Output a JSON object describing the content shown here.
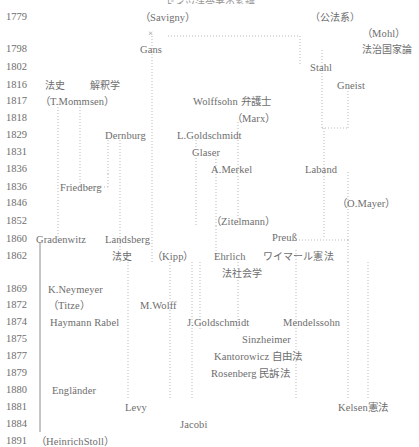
{
  "document": {
    "title": "ドイツ法学者の系譜",
    "type": "genealogy-chart",
    "orientation": "vertical-timeline"
  },
  "axis": {
    "label": "birth-year",
    "years": [
      "1779",
      "1798",
      "1802",
      "1816",
      "1817",
      "1818",
      "1829",
      "1831",
      "1836",
      "1836",
      "1846",
      "1852",
      "1860",
      "1862",
      "1869",
      "1872",
      "1874",
      "1875",
      "1877",
      "1879",
      "1880",
      "1881",
      "1884",
      "1891"
    ]
  },
  "nodes": [
    {
      "id": "savigny",
      "label": "（Savigny）",
      "x": 140,
      "y": 12,
      "jp": false
    },
    {
      "id": "koho-kei",
      "label": "（公法系）",
      "x": 310,
      "y": 12,
      "jp": true
    },
    {
      "id": "cross",
      "label": "×",
      "x": 148,
      "y": 28,
      "jp": false
    },
    {
      "id": "mohl",
      "label": "（Mohl）",
      "x": 362,
      "y": 28,
      "jp": false
    },
    {
      "id": "gans",
      "label": "Gans",
      "x": 140,
      "y": 44,
      "jp": false
    },
    {
      "id": "hochikokka",
      "label": "法治国家論",
      "x": 362,
      "y": 44,
      "jp": true
    },
    {
      "id": "stahl",
      "label": "Stahl",
      "x": 310,
      "y": 62,
      "jp": false
    },
    {
      "id": "hoshi1",
      "label": "法史",
      "x": 45,
      "y": 80,
      "jp": true
    },
    {
      "id": "kaishakugaku",
      "label": "解釈学",
      "x": 90,
      "y": 80,
      "jp": true
    },
    {
      "id": "gneist",
      "label": "Gneist",
      "x": 337,
      "y": 80,
      "jp": false
    },
    {
      "id": "tmommsen",
      "label": "（T.Mommsen）",
      "x": 40,
      "y": 96,
      "jp": false
    },
    {
      "id": "wolffsohn",
      "label": "Wolffsohn 弁護士",
      "x": 193,
      "y": 96,
      "jp": false
    },
    {
      "id": "marx",
      "label": "（Marx）",
      "x": 232,
      "y": 113,
      "jp": false
    },
    {
      "id": "dernburg",
      "label": "Dernburg",
      "x": 105,
      "y": 130,
      "jp": false
    },
    {
      "id": "lgoldschmidt",
      "label": "L.Goldschmidt",
      "x": 177,
      "y": 130,
      "jp": false
    },
    {
      "id": "glaser",
      "label": "Glaser",
      "x": 192,
      "y": 147,
      "jp": false
    },
    {
      "id": "amerkel",
      "label": "A.Merkel",
      "x": 211,
      "y": 164,
      "jp": false
    },
    {
      "id": "laband",
      "label": "Laband",
      "x": 305,
      "y": 164,
      "jp": false
    },
    {
      "id": "friedberg",
      "label": "Friedberg",
      "x": 60,
      "y": 182,
      "jp": false
    },
    {
      "id": "omayer",
      "label": "（O.Mayer）",
      "x": 337,
      "y": 198,
      "jp": false
    },
    {
      "id": "zitelmann",
      "label": "（Zitelmann）",
      "x": 211,
      "y": 216,
      "jp": false
    },
    {
      "id": "preuss",
      "label": "Preuß",
      "x": 272,
      "y": 232,
      "jp": false
    },
    {
      "id": "gradenwitz",
      "label": "Gradenwitz",
      "x": 36,
      "y": 234,
      "jp": false
    },
    {
      "id": "landsberg",
      "label": "Landsberg",
      "x": 105,
      "y": 234,
      "jp": false
    },
    {
      "id": "hoshi2",
      "label": "法史",
      "x": 112,
      "y": 251,
      "jp": true
    },
    {
      "id": "kipp",
      "label": "（Kipp）",
      "x": 152,
      "y": 251,
      "jp": false
    },
    {
      "id": "ehrlich",
      "label": "Ehrlich",
      "x": 214,
      "y": 251,
      "jp": false
    },
    {
      "id": "weimar",
      "label": "ワイマール憲法",
      "x": 263,
      "y": 251,
      "jp": true
    },
    {
      "id": "hoshakaigaku",
      "label": "法社会学",
      "x": 222,
      "y": 268,
      "jp": true
    },
    {
      "id": "kneymeyer",
      "label": "K.Neymeyer",
      "x": 48,
      "y": 284,
      "jp": false
    },
    {
      "id": "titze",
      "label": "（Titze）",
      "x": 48,
      "y": 300,
      "jp": false
    },
    {
      "id": "mwolff",
      "label": "M.Wolff",
      "x": 140,
      "y": 300,
      "jp": false
    },
    {
      "id": "haymann",
      "label": "Haymann Rabel",
      "x": 50,
      "y": 317,
      "jp": false
    },
    {
      "id": "jgoldschmidt",
      "label": "J.Goldschmidt",
      "x": 187,
      "y": 317,
      "jp": false
    },
    {
      "id": "mendelssohn",
      "label": "Mendelssohn",
      "x": 283,
      "y": 317,
      "jp": false
    },
    {
      "id": "sinzheimer",
      "label": "Sinzheimer",
      "x": 242,
      "y": 334,
      "jp": false
    },
    {
      "id": "kantorowicz",
      "label": "Kantorowicz 自由法",
      "x": 214,
      "y": 351,
      "jp": false
    },
    {
      "id": "rosenberg",
      "label": "Rosenberg 民訴法",
      "x": 211,
      "y": 368,
      "jp": false
    },
    {
      "id": "englander",
      "label": "Engländer",
      "x": 52,
      "y": 385,
      "jp": false
    },
    {
      "id": "levy",
      "label": "Levy",
      "x": 125,
      "y": 402,
      "jp": false
    },
    {
      "id": "kelsen",
      "label": "Kelsen憲法",
      "x": 338,
      "y": 402,
      "jp": false
    },
    {
      "id": "jacobi",
      "label": "Jacobi",
      "x": 180,
      "y": 419,
      "jp": false
    },
    {
      "id": "heinrichstoll",
      "label": "（HeinrichStoll）",
      "x": 36,
      "y": 436,
      "jp": false
    }
  ],
  "edges": {
    "dotted_paths": [
      "M152,36 L152,243",
      "M152,243 L152,262",
      "M58,104 L58,242",
      "M80,104 L80,187",
      "M80,187 L108,187",
      "M108,187 L108,174",
      "M108,174 L108,140",
      "M120,140 L120,240",
      "M120,240 L120,262",
      "M168,36 L300,36",
      "M300,36 L300,66",
      "M322,50 L322,70",
      "M322,70 L322,128",
      "M322,128 L348,128",
      "M348,128 L348,86",
      "M324,128 L324,238",
      "M348,172 L348,206",
      "M348,206 L348,240",
      "M196,140 L196,226",
      "M216,156 L216,226",
      "M216,226 L216,258",
      "M238,122 L238,226",
      "M296,240 L348,240",
      "M348,240 L348,262",
      "M200,262 L200,330",
      "M238,262 L238,330",
      "M170,262 L170,400",
      "M192,262 L192,400",
      "M348,262 L348,400",
      "M368,262 L368,400",
      "M296,250 L296,400",
      "M128,256 L128,398"
    ],
    "solid_paths": [
      "M40,242 L40,432"
    ]
  },
  "style": {
    "text_color": "#6e6e6e",
    "line_color": "#b9b9b9",
    "solid_line_color": "#8c8c8c",
    "background": "#ffffff"
  }
}
